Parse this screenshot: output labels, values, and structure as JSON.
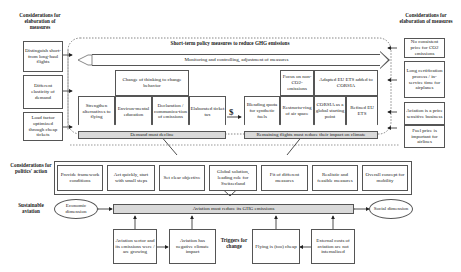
{
  "left_column": {
    "title": "Considerations for elaboration of measures",
    "items": [
      "Distinguish short- from long-haul flights",
      "Different elasticity of demand",
      "Load factor optimized through cheap tickets"
    ]
  },
  "right_column": {
    "title": "Considerations for elaboration of measures",
    "items": [
      "No consistent price for CO2 emissions",
      "Long certification process / in-service time for airplanes",
      "Aviation is a price sensitive business",
      "Fuel price is important for airlines"
    ]
  },
  "policy": {
    "title": "Short-term policy measures to reduce GHG emissions",
    "monitoring": "Monitoring and controlling, adjustment of measures",
    "demand": {
      "group_label": "Change of thinking to change behavior",
      "measures": [
        "Strengthen alternatives to flying",
        "Environ-mental education",
        "Declaration / communica-tion of emissions",
        "Elaborated ticket tax"
      ],
      "outcome": "Demand must decline"
    },
    "dollar_symbol": "$",
    "supply": {
      "top_labels": [
        "Focus on non-CO2-emissions",
        "Adapted EU ETS added to CORSIA"
      ],
      "measures": [
        "Blending quota for synthetic fuels",
        "Restructu-ring of air space",
        "CORSIA as a global starting point",
        "Refined EU ETS"
      ],
      "outcome": "Remaining flights must reduce their impact on climate"
    }
  },
  "politics": {
    "title": "Considerations for politics' action",
    "items": [
      "Provide framework conditions",
      "Act quickly, start with small steps",
      "Set clear objective",
      "Global solution, leading role for Switzerland",
      "Fit of different measures",
      "Realistic and feasible measures",
      "Overall concept for mobility"
    ]
  },
  "sustainable": {
    "title": "Sustainable aviation",
    "economic": "Economic dimension",
    "main": "Aviation must reduce its GHG emissions",
    "social": "Social dimension"
  },
  "triggers": {
    "title": "Triggers for change",
    "items": [
      "Aviation sector and its emissions were / are growing",
      "Aviation has negative climate impact",
      "Flying is (too) cheap",
      "External costs of aviation are not internalized"
    ]
  }
}
